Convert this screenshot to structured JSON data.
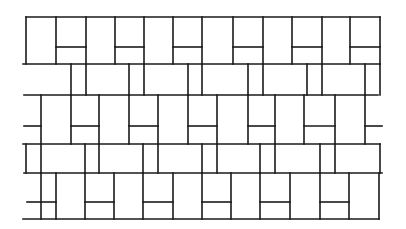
{
  "diagram": {
    "type": "line-drawing",
    "stroke_color": "#1a1a1a",
    "background_color": "#ffffff",
    "horizontal_lines": [
      {
        "y": 17,
        "x1": 26,
        "x2": 380
      },
      {
        "y": 64,
        "x1": 23,
        "x2": 380
      },
      {
        "y": 95,
        "x1": 24,
        "x2": 378
      },
      {
        "y": 144,
        "x1": 23,
        "x2": 380
      },
      {
        "y": 173,
        "x1": 24,
        "x2": 382
      },
      {
        "y": 219,
        "x1": 23,
        "x2": 379
      }
    ],
    "bands": [
      {
        "name": "band-1",
        "y1": 17,
        "y2": 64,
        "verticals": [
          26,
          56,
          86,
          115,
          144,
          173,
          202,
          233,
          263,
          292,
          322,
          350,
          380
        ],
        "split_y": 47,
        "splits": [
          [
            56,
            86
          ],
          [
            115,
            144
          ],
          [
            173,
            202
          ],
          [
            233,
            263
          ],
          [
            292,
            322
          ],
          [
            350,
            380
          ]
        ]
      },
      {
        "name": "band-2",
        "y1": 64,
        "y2": 95,
        "verticals": [
          71,
          86,
          129,
          144,
          188,
          202,
          248,
          263,
          307,
          322,
          365,
          380
        ],
        "split_y": null,
        "splits": []
      },
      {
        "name": "band-3",
        "y1": 95,
        "y2": 144,
        "verticals": [
          41,
          71,
          99,
          129,
          158,
          188,
          217,
          248,
          275,
          304,
          335,
          365
        ],
        "split_y": 126,
        "splits": [
          [
            24,
            41
          ],
          [
            71,
            99
          ],
          [
            129,
            158
          ],
          [
            188,
            217
          ],
          [
            248,
            275
          ],
          [
            304,
            335
          ],
          [
            365,
            382
          ]
        ]
      },
      {
        "name": "band-4",
        "y1": 144,
        "y2": 173,
        "verticals": [
          26,
          41,
          85,
          99,
          143,
          158,
          202,
          217,
          260,
          275,
          320,
          335,
          380
        ],
        "split_y": null,
        "splits": []
      },
      {
        "name": "band-5",
        "y1": 173,
        "y2": 219,
        "verticals": [
          41,
          56,
          85,
          114,
          143,
          173,
          202,
          231,
          260,
          290,
          320,
          349,
          379
        ],
        "split_y": 202,
        "splits": [
          [
            27,
            56
          ],
          [
            85,
            114
          ],
          [
            143,
            173
          ],
          [
            202,
            231
          ],
          [
            260,
            290
          ],
          [
            320,
            349
          ]
        ]
      }
    ]
  }
}
